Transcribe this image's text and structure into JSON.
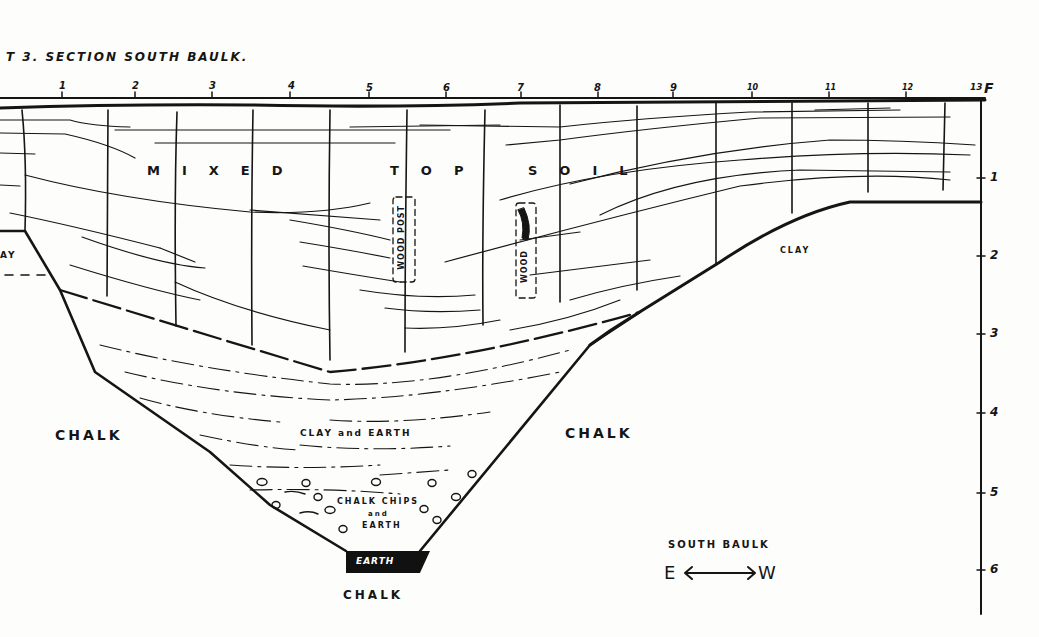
{
  "title": "T 3.  SECTION SOUTH BAULK.",
  "horizontal_scale": {
    "ticks": [
      {
        "label": "1",
        "x": 62
      },
      {
        "label": "2",
        "x": 135
      },
      {
        "label": "3",
        "x": 212
      },
      {
        "label": "4",
        "x": 290
      },
      {
        "label": "5",
        "x": 369
      },
      {
        "label": "6",
        "x": 446
      },
      {
        "label": "7",
        "x": 521
      },
      {
        "label": "8",
        "x": 598
      },
      {
        "label": "9",
        "x": 673
      },
      {
        "label": "10",
        "x": 752
      },
      {
        "label": "11",
        "x": 829
      },
      {
        "label": "12",
        "x": 906
      },
      {
        "label": "13",
        "x": 975
      }
    ],
    "unit": "F"
  },
  "vertical_scale": {
    "ticks": [
      {
        "label": "1",
        "y": 178
      },
      {
        "label": "2",
        "y": 256
      },
      {
        "label": "3",
        "y": 334
      },
      {
        "label": "4",
        "y": 413
      },
      {
        "label": "5",
        "y": 493
      },
      {
        "label": "6",
        "y": 570
      }
    ]
  },
  "layers": {
    "topsoil": "M I X E D     T O P     S O I L",
    "topsoil_words": [
      "MIXED",
      "TOP",
      "SOIL"
    ],
    "clay_left": "AY",
    "clay_right": "CLAY",
    "chalk_left": "CHALK",
    "chalk_right": "CHALK",
    "chalk_bottom": "CHALK",
    "clay_and_earth": "CLAY and EARTH",
    "chalk_chips_1": "CHALK CHIPS",
    "chalk_chips_2": "and",
    "chalk_chips_3": "EARTH",
    "earth_base": "EARTH",
    "wood_post": "WOOD POST",
    "wood": "WOOD"
  },
  "legend": {
    "label": "SOUTH BAULK",
    "east": "E",
    "west": "W",
    "arrow": "⟷"
  },
  "colors": {
    "ink": "#151515",
    "paper": "#fdfdfb"
  }
}
